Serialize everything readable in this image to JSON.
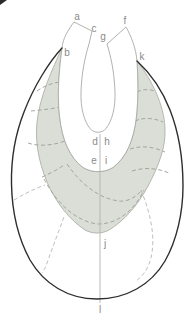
{
  "figure": {
    "labels": [
      {
        "id": "a",
        "char": "a"
      },
      {
        "id": "b",
        "char": "b"
      },
      {
        "id": "c",
        "char": "c"
      },
      {
        "id": "d",
        "char": "d"
      },
      {
        "id": "e",
        "char": "e"
      },
      {
        "id": "f",
        "char": "f"
      },
      {
        "id": "g",
        "char": "g"
      },
      {
        "id": "h",
        "char": "h"
      },
      {
        "id": "i",
        "char": "i"
      },
      {
        "id": "j",
        "char": "j"
      },
      {
        "id": "k",
        "char": "k"
      },
      {
        "id": "l",
        "char": "l"
      }
    ],
    "colors": {
      "background": "#ffffff",
      "outline": "#2e2e2e",
      "shaded_region": "#dbded7",
      "thin_line": "#adb1a8",
      "dashed_line": "#9aa094",
      "label_text": "#8a8a8a"
    }
  }
}
